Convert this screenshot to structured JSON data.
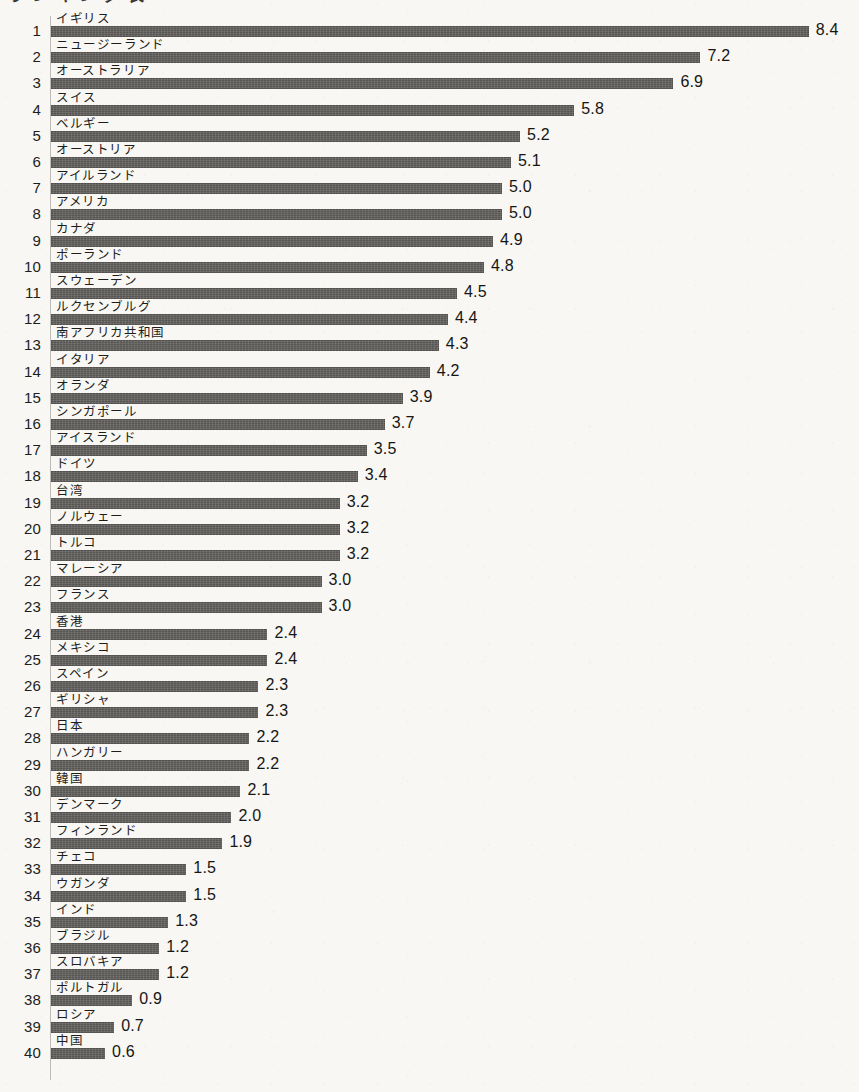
{
  "header": {
    "title_remnant": "ランキング表"
  },
  "axis": {
    "baseline_x": 51,
    "px_per_unit": 90.2,
    "row_pitch": 26.2,
    "bar_color": "#575653",
    "text_color": "#1d1d1b",
    "background_color": "#f8f7f3"
  },
  "chart_data": {
    "type": "bar",
    "orientation": "horizontal",
    "title": "",
    "subtitle": "",
    "xlabel": "",
    "ylabel": "",
    "grid": false,
    "legend": null,
    "xlim": [
      0,
      8.4
    ],
    "sorted": "descending",
    "rank_label_shown": true,
    "value_label_shown": true,
    "value_precision": 1,
    "categories": [
      "イギリス",
      "ニュージーランド",
      "オーストラリア",
      "スイス",
      "ベルギー",
      "オーストリア",
      "アイルランド",
      "アメリカ",
      "カナダ",
      "ポーランド",
      "スウェーデン",
      "ルクセンブルグ",
      "南アフリカ共和国",
      "イタリア",
      "オランダ",
      "シンガポール",
      "アイスランド",
      "ドイツ",
      "台湾",
      "ノルウェー",
      "トルコ",
      "マレーシア",
      "フランス",
      "香港",
      "メキシコ",
      "スペイン",
      "ギリシャ",
      "日本",
      "ハンガリー",
      "韓国",
      "デンマーク",
      "フィンランド",
      "チェコ",
      "ウガンダ",
      "インド",
      "ブラジル",
      "スロバキア",
      "ポルトガル",
      "ロシア",
      "中国"
    ],
    "ranks": [
      1,
      2,
      3,
      4,
      5,
      6,
      7,
      8,
      9,
      10,
      11,
      12,
      13,
      14,
      15,
      16,
      17,
      18,
      19,
      20,
      21,
      22,
      23,
      24,
      25,
      26,
      27,
      28,
      29,
      30,
      31,
      32,
      33,
      34,
      35,
      36,
      37,
      38,
      39,
      40
    ],
    "values": [
      8.4,
      7.2,
      6.9,
      5.8,
      5.2,
      5.1,
      5.0,
      5.0,
      4.9,
      4.8,
      4.5,
      4.4,
      4.3,
      4.2,
      3.9,
      3.7,
      3.5,
      3.4,
      3.2,
      3.2,
      3.2,
      3.0,
      3.0,
      2.4,
      2.4,
      2.3,
      2.3,
      2.2,
      2.2,
      2.1,
      2.0,
      1.9,
      1.5,
      1.5,
      1.3,
      1.2,
      1.2,
      0.9,
      0.7,
      0.6
    ],
    "value_labels": [
      "8.4",
      "7.2",
      "6.9",
      "5.8",
      "5.2",
      "5.1",
      "5.0",
      "5.0",
      "4.9",
      "4.8",
      "4.5",
      "4.4",
      "4.3",
      "4.2",
      "3.9",
      "3.7",
      "3.5",
      "3.4",
      "3.2",
      "3.2",
      "3.2",
      "3.0",
      "3.0",
      "2.4",
      "2.4",
      "2.3",
      "2.3",
      "2.2",
      "2.2",
      "2.1",
      "2.0",
      "1.9",
      "1.5",
      "1.5",
      "1.3",
      "1.2",
      "1.2",
      "0.9",
      "0.7",
      "0.6"
    ]
  }
}
